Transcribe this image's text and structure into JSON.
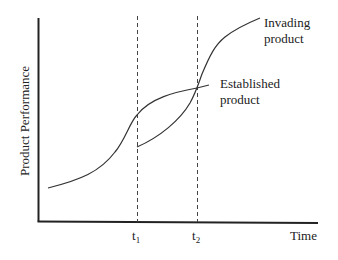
{
  "diagram": {
    "type": "technology-s-curves",
    "axes": {
      "y_label": "Product Performance",
      "x_label": "Time"
    },
    "markers": [
      {
        "id": "t1",
        "base": "t",
        "sub": "1"
      },
      {
        "id": "t2",
        "base": "t",
        "sub": "2"
      }
    ],
    "curves": {
      "established": {
        "label_line1": "Established",
        "label_line2": "product"
      },
      "invading": {
        "label_line1": "Invading",
        "label_line2": "product"
      }
    },
    "colors": {
      "line": "#333333",
      "text": "#222222",
      "background": "#ffffff"
    }
  }
}
